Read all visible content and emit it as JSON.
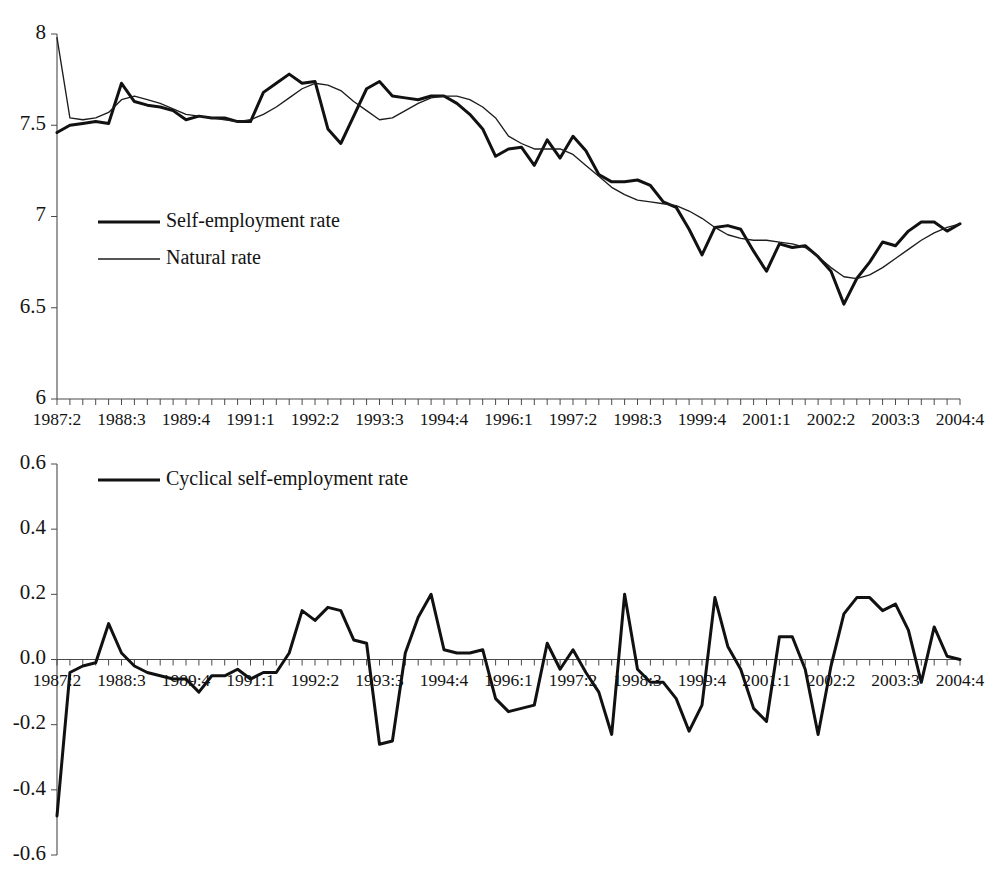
{
  "figure": {
    "width": 998,
    "height": 879,
    "background": "#ffffff",
    "line_color": "#111111",
    "axis_color": "#4a4a4a"
  },
  "chart_data": [
    {
      "id": "top",
      "type": "line",
      "title": "",
      "subtitle": "",
      "xlabel": "",
      "ylabel": "",
      "grid": false,
      "legend_position": "inside-left",
      "ylim": [
        6,
        8
      ],
      "yticks": [
        "6",
        "6.5",
        "7",
        "7.5",
        "8"
      ],
      "ytick_values": [
        6,
        6.5,
        7,
        7.5,
        8
      ],
      "x": [
        "1987:2",
        "1987:3",
        "1987:4",
        "1988:1",
        "1988:2",
        "1988:3",
        "1988:4",
        "1989:1",
        "1989:2",
        "1989:3",
        "1989:4",
        "1990:1",
        "1990:2",
        "1990:3",
        "1990:4",
        "1991:1",
        "1991:2",
        "1991:3",
        "1991:4",
        "1992:1",
        "1992:2",
        "1992:3",
        "1992:4",
        "1993:1",
        "1993:2",
        "1993:3",
        "1993:4",
        "1994:1",
        "1994:2",
        "1994:3",
        "1994:4",
        "1995:1",
        "1995:2",
        "1995:3",
        "1995:4",
        "1996:1",
        "1996:2",
        "1996:3",
        "1996:4",
        "1997:1",
        "1997:2",
        "1997:3",
        "1997:4",
        "1998:1",
        "1998:2",
        "1998:3",
        "1998:4",
        "1999:1",
        "1999:2",
        "1999:3",
        "1999:4",
        "2000:1",
        "2000:2",
        "2000:3",
        "2000:4",
        "2001:1",
        "2001:2",
        "2001:3",
        "2001:4",
        "2002:1",
        "2002:2",
        "2002:3",
        "2002:4",
        "2003:1",
        "2003:2",
        "2003:3",
        "2003:4",
        "2004:1",
        "2004:2",
        "2004:3",
        "2004:4"
      ],
      "xtick_labels": [
        "1987:2",
        "1988:3",
        "1989:4",
        "1991:1",
        "1992:2",
        "1993:3",
        "1994:4",
        "1996:1",
        "1997:2",
        "1998:3",
        "1999:4",
        "2001:1",
        "2002:2",
        "2003:3",
        "2004:4"
      ],
      "xtick_indices": [
        0,
        5,
        10,
        15,
        20,
        25,
        30,
        35,
        40,
        45,
        50,
        55,
        60,
        65,
        70
      ],
      "series": [
        {
          "name": "Self-employment rate",
          "style": "thick",
          "values": [
            7.46,
            7.5,
            7.51,
            7.52,
            7.51,
            7.73,
            7.63,
            7.61,
            7.6,
            7.58,
            7.53,
            7.55,
            7.54,
            7.54,
            7.52,
            7.52,
            7.68,
            7.73,
            7.78,
            7.73,
            7.74,
            7.48,
            7.4,
            7.55,
            7.7,
            7.74,
            7.66,
            7.65,
            7.64,
            7.66,
            7.66,
            7.62,
            7.56,
            7.48,
            7.33,
            7.37,
            7.38,
            7.28,
            7.42,
            7.32,
            7.44,
            7.36,
            7.23,
            7.19,
            7.19,
            7.2,
            7.17,
            7.08,
            7.05,
            6.93,
            6.79,
            6.94,
            6.95,
            6.93,
            6.81,
            6.7,
            6.85,
            6.83,
            6.84,
            6.78,
            6.7,
            6.52,
            6.66,
            6.75,
            6.86,
            6.84,
            6.92,
            6.97,
            6.97,
            6.92,
            6.96
          ]
        },
        {
          "name": "Natural rate",
          "style": "thin",
          "values": [
            7.98,
            7.54,
            7.53,
            7.54,
            7.57,
            7.64,
            7.66,
            7.64,
            7.62,
            7.59,
            7.56,
            7.55,
            7.54,
            7.53,
            7.52,
            7.53,
            7.56,
            7.6,
            7.65,
            7.7,
            7.73,
            7.72,
            7.69,
            7.63,
            7.58,
            7.53,
            7.54,
            7.58,
            7.62,
            7.65,
            7.66,
            7.66,
            7.64,
            7.6,
            7.54,
            7.44,
            7.4,
            7.37,
            7.37,
            7.37,
            7.34,
            7.28,
            7.22,
            7.16,
            7.12,
            7.09,
            7.08,
            7.07,
            7.06,
            7.03,
            6.99,
            6.94,
            6.9,
            6.88,
            6.87,
            6.87,
            6.86,
            6.85,
            6.83,
            6.78,
            6.72,
            6.67,
            6.66,
            6.68,
            6.72,
            6.77,
            6.82,
            6.87,
            6.91,
            6.94,
            6.96
          ]
        }
      ]
    },
    {
      "id": "bottom",
      "type": "line",
      "title": "",
      "subtitle": "",
      "xlabel": "",
      "ylabel": "",
      "grid": false,
      "legend_position": "inside-top-left",
      "ylim": [
        -0.6,
        0.6
      ],
      "yticks": [
        "0.6",
        "0.4",
        "0.2",
        "0.0",
        "-0.2",
        "-0.4",
        "-0.6"
      ],
      "ytick_values": [
        0.6,
        0.4,
        0.2,
        0.0,
        -0.2,
        -0.4,
        -0.6
      ],
      "x": [
        "1987:2",
        "1987:3",
        "1987:4",
        "1988:1",
        "1988:2",
        "1988:3",
        "1988:4",
        "1989:1",
        "1989:2",
        "1989:3",
        "1989:4",
        "1990:1",
        "1990:2",
        "1990:3",
        "1990:4",
        "1991:1",
        "1991:2",
        "1991:3",
        "1991:4",
        "1992:1",
        "1992:2",
        "1992:3",
        "1992:4",
        "1993:1",
        "1993:2",
        "1993:3",
        "1993:4",
        "1994:1",
        "1994:2",
        "1994:3",
        "1994:4",
        "1995:1",
        "1995:2",
        "1995:3",
        "1995:4",
        "1996:1",
        "1996:2",
        "1996:3",
        "1996:4",
        "1997:1",
        "1997:2",
        "1997:3",
        "1997:4",
        "1998:1",
        "1998:2",
        "1998:3",
        "1998:4",
        "1999:1",
        "1999:2",
        "1999:3",
        "1999:4",
        "2000:1",
        "2000:2",
        "2000:3",
        "2000:4",
        "2001:1",
        "2001:2",
        "2001:3",
        "2001:4",
        "2002:1",
        "2002:2",
        "2002:3",
        "2002:4",
        "2003:1",
        "2003:2",
        "2003:3",
        "2003:4",
        "2004:1",
        "2004:2",
        "2004:3",
        "2004:4"
      ],
      "xtick_labels": [
        "1987:2",
        "1988:3",
        "1989:4",
        "1991:1",
        "1992:2",
        "1993:3",
        "1994:4",
        "1996:1",
        "1997:2",
        "1998:3",
        "1999:4",
        "2001:1",
        "2002:2",
        "2003:3",
        "2004:4"
      ],
      "xtick_indices": [
        0,
        5,
        10,
        15,
        20,
        25,
        30,
        35,
        40,
        45,
        50,
        55,
        60,
        65,
        70
      ],
      "series": [
        {
          "name": "Cyclical self-employment rate",
          "style": "thick",
          "values": [
            -0.48,
            -0.04,
            -0.02,
            -0.01,
            0.11,
            0.02,
            -0.02,
            -0.04,
            -0.05,
            -0.06,
            -0.06,
            -0.1,
            -0.05,
            -0.05,
            -0.03,
            -0.06,
            -0.04,
            -0.04,
            0.02,
            0.15,
            0.12,
            0.16,
            0.15,
            0.06,
            0.05,
            -0.26,
            -0.25,
            0.02,
            0.13,
            0.2,
            0.03,
            0.02,
            0.02,
            0.03,
            -0.12,
            -0.16,
            -0.15,
            -0.14,
            0.05,
            -0.03,
            0.03,
            -0.04,
            -0.1,
            -0.23,
            0.2,
            -0.03,
            -0.07,
            -0.07,
            -0.12,
            -0.22,
            -0.14,
            0.19,
            0.04,
            -0.03,
            -0.15,
            -0.19,
            0.07,
            0.07,
            -0.03,
            -0.23,
            -0.02,
            0.14,
            0.19,
            0.19,
            0.15,
            0.17,
            0.09,
            -0.07,
            0.1,
            0.01,
            0.0
          ]
        }
      ]
    }
  ],
  "top_chart": {
    "legend": [
      {
        "label": "Self-employment rate",
        "style": "thick"
      },
      {
        "label": "Natural rate",
        "style": "thin"
      }
    ]
  },
  "bottom_chart": {
    "legend": [
      {
        "label": "Cyclical self-employment rate",
        "style": "thick"
      }
    ]
  }
}
